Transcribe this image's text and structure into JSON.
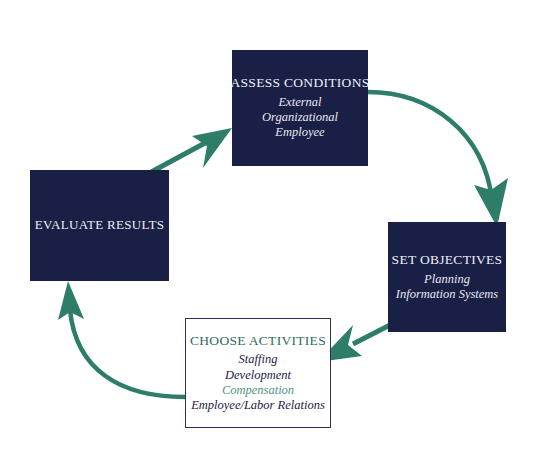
{
  "diagram": {
    "type": "cycle",
    "accent_color": "#2e7d68",
    "box_fill_color": "#191f45",
    "box_text_color": "#ffffff",
    "light_box_border_color": "#2b3158",
    "light_box_title_color": "#2f6b5c",
    "highlight_item_color": "#4f9384",
    "background_color": "#ffffff",
    "nodes": [
      {
        "id": "assess",
        "title": "ASSESS CONDITIONS",
        "style": "dark",
        "items": [
          "External",
          "Organizational",
          "Employee"
        ]
      },
      {
        "id": "objectives",
        "title": "SET OBJECTIVES",
        "style": "dark",
        "items": [
          "Planning",
          "Information Systems"
        ]
      },
      {
        "id": "activities",
        "title": "CHOOSE ACTIVITIES",
        "style": "light",
        "items": [
          "Staffing",
          "Development",
          "Compensation",
          "Employee/Labor Relations"
        ],
        "highlight_item": "Compensation"
      },
      {
        "id": "evaluate",
        "title": "EVALUATE RESULTS",
        "style": "dark",
        "items": []
      }
    ],
    "arrows": [
      {
        "id": "assess-to-objectives",
        "shape": "curved",
        "from": "assess",
        "to": "objectives",
        "direction": "clockwise"
      },
      {
        "id": "objectives-to-activities",
        "shape": "straight",
        "from": "objectives",
        "to": "activities",
        "direction": "clockwise"
      },
      {
        "id": "activities-to-evaluate",
        "shape": "curved",
        "from": "activities",
        "to": "evaluate",
        "direction": "clockwise"
      },
      {
        "id": "evaluate-to-assess",
        "shape": "straight",
        "from": "evaluate",
        "to": "assess",
        "direction": "clockwise"
      }
    ]
  }
}
